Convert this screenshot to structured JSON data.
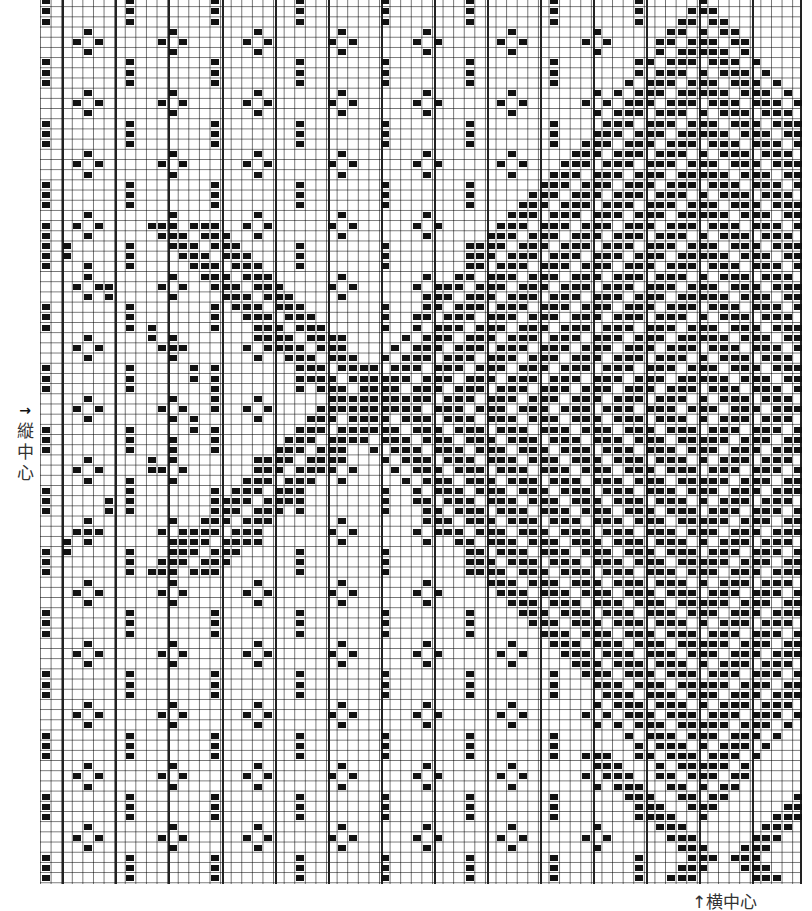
{
  "labels": {
    "vertical_center_arrow": "→",
    "vertical_center_chars": [
      "縦",
      "中",
      "心"
    ],
    "horizontal_center": "↑横中心"
  },
  "grid": {
    "origin_x": 40,
    "origin_y": -4,
    "cell_w": 10.6,
    "cell_h": 10.2,
    "cols": 72,
    "rows": 87,
    "bold_every": 5,
    "bold_first_x": 62,
    "bold_xs": [
      62,
      115,
      168,
      222,
      275,
      328,
      381,
      434,
      487,
      540,
      593,
      646,
      699,
      752
    ],
    "line_color": "#999999",
    "bold_color": "#222222",
    "fill_color": "#111111"
  },
  "motifs": {
    "bar_stack_columns": [
      0,
      8,
      16,
      24,
      32,
      40,
      48,
      56
    ],
    "bar_stack_period_rows": 6,
    "bar_stack_size": 3,
    "diamond_columns": [
      4,
      12,
      20,
      28,
      36,
      44,
      52
    ],
    "diamond_period_rows": 6,
    "diamond_offset_rows": 3
  },
  "x_pattern": {
    "small_x": {
      "center_col": 30,
      "center_row": 39,
      "half_width_cols": 18,
      "half_height_rows": 17
    },
    "large_diamond": {
      "center_col": 62,
      "center_row": 40,
      "half_width_cols": 34,
      "half_height_rows": 40
    },
    "bottom_x": {
      "center_col": 64,
      "center_row": 84
    },
    "stroke_len_cells": 3,
    "stroke_step_cols": 1
  }
}
